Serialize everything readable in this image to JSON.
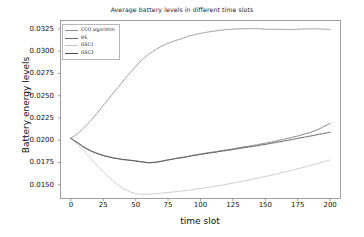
{
  "chart_data": {
    "type": "line",
    "title": "Average battery levels in different time slots",
    "xlabel": "time slot",
    "ylabel": "Battery energy levels",
    "xlim": [
      -8,
      208
    ],
    "ylim": [
      0.01345,
      0.03345
    ],
    "xticks": [
      0,
      25,
      50,
      75,
      100,
      125,
      150,
      175,
      200
    ],
    "xtick_labels": [
      "0",
      "25",
      "50",
      "75",
      "100",
      "125",
      "150",
      "175",
      "200"
    ],
    "yticks": [
      0.015,
      0.0175,
      0.02,
      0.0225,
      0.025,
      0.0275,
      0.03,
      0.0325
    ],
    "ytick_labels": [
      "0.0150",
      "0.0175",
      "0.0200",
      "0.0225",
      "0.0250",
      "0.0275",
      "0.0300",
      "0.0325"
    ],
    "grid": false,
    "legend_position": "upper left",
    "x": [
      0,
      5,
      10,
      15,
      20,
      25,
      30,
      35,
      40,
      45,
      50,
      55,
      60,
      65,
      70,
      75,
      80,
      85,
      90,
      95,
      100,
      105,
      110,
      115,
      120,
      125,
      130,
      135,
      140,
      145,
      150,
      155,
      160,
      165,
      170,
      175,
      180,
      185,
      190,
      195,
      200
    ],
    "series": [
      {
        "name": "CCO algorithm",
        "color": "#8c8c8c",
        "values": [
          0.02022,
          0.0207,
          0.0214,
          0.02215,
          0.023,
          0.0239,
          0.0248,
          0.0257,
          0.0266,
          0.02745,
          0.0283,
          0.02905,
          0.02965,
          0.03015,
          0.03055,
          0.0309,
          0.03115,
          0.0314,
          0.03165,
          0.03185,
          0.032,
          0.03213,
          0.03225,
          0.03235,
          0.03243,
          0.03248,
          0.0325,
          0.03252,
          0.03254,
          0.03252,
          0.03248,
          0.03246,
          0.03247,
          0.03245,
          0.03243,
          0.03246,
          0.0325,
          0.03252,
          0.03251,
          0.03248,
          0.03246
        ]
      },
      {
        "name": "RS",
        "color": "#6e6e6e",
        "values": [
          0.02022,
          0.01975,
          0.01925,
          0.01885,
          0.01855,
          0.0183,
          0.01812,
          0.01797,
          0.01785,
          0.01776,
          0.01768,
          0.01758,
          0.01748,
          0.01752,
          0.01765,
          0.0178,
          0.01793,
          0.01806,
          0.01818,
          0.01832,
          0.01845,
          0.01857,
          0.01868,
          0.0188,
          0.01892,
          0.01903,
          0.01916,
          0.01928,
          0.0194,
          0.01953,
          0.01966,
          0.0198,
          0.01996,
          0.02012,
          0.0203,
          0.02048,
          0.02068,
          0.0209,
          0.02115,
          0.02152,
          0.0219
        ]
      },
      {
        "name": "GSC1",
        "color": "#c4c4c4",
        "values": [
          0.02022,
          0.01955,
          0.0188,
          0.018,
          0.0172,
          0.01645,
          0.01575,
          0.01512,
          0.0146,
          0.01422,
          0.014,
          0.01392,
          0.01393,
          0.01398,
          0.01405,
          0.01412,
          0.0142,
          0.01428,
          0.01437,
          0.01447,
          0.01457,
          0.01468,
          0.0148,
          0.01492,
          0.01505,
          0.01518,
          0.01532,
          0.01546,
          0.01561,
          0.01576,
          0.01592,
          0.01608,
          0.01625,
          0.01642,
          0.0166,
          0.01678,
          0.01697,
          0.01716,
          0.01736,
          0.01757,
          0.01779
        ]
      },
      {
        "name": "GSC2",
        "color": "#4a4a4a",
        "values": [
          0.02022,
          0.01972,
          0.0192,
          0.0188,
          0.0185,
          0.01826,
          0.01808,
          0.01794,
          0.01783,
          0.01774,
          0.01765,
          0.01755,
          0.01745,
          0.0175,
          0.01762,
          0.01777,
          0.0179,
          0.01802,
          0.01814,
          0.01827,
          0.0184,
          0.01851,
          0.01862,
          0.01873,
          0.01884,
          0.01895,
          0.01907,
          0.01918,
          0.01929,
          0.01941,
          0.01953,
          0.01966,
          0.01979,
          0.01992,
          0.02006,
          0.0202,
          0.02034,
          0.02048,
          0.02062,
          0.02076,
          0.0209
        ]
      }
    ]
  },
  "legend": {
    "items": [
      {
        "label": "CCO algorithm"
      },
      {
        "label": "RS"
      },
      {
        "label": "GSC1"
      },
      {
        "label": "GSC2"
      }
    ]
  }
}
